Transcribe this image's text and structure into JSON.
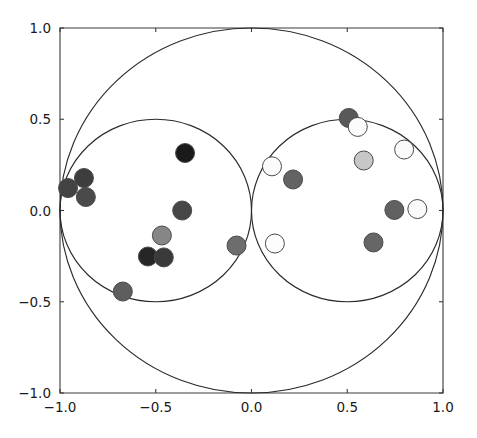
{
  "figure": {
    "title": "",
    "background_color": "#ffffff",
    "axes_color": "#3a3a3a",
    "curve_color": "#2b2b2b",
    "marker_edge_color": "#4a4a4a"
  },
  "chart_data": {
    "type": "scatter",
    "title": "",
    "xlabel": "",
    "ylabel": "",
    "xlim": [
      -1.0,
      1.0
    ],
    "ylim": [
      -1.0,
      1.0
    ],
    "grid": false,
    "legend": null,
    "xticks": [
      -1.0,
      0.0,
      0.5,
      1.0,
      -0.5
    ],
    "xtick_labels": [
      "-1.0",
      "-0.5",
      "0.0",
      "0.5",
      "1.0"
    ],
    "xtick_values": [
      -1.0,
      -0.5,
      0.0,
      0.5,
      1.0
    ],
    "ytick_labels": [
      "-1.0",
      "-0.5",
      "0.0",
      "0.5",
      "1.0"
    ],
    "ytick_values": [
      -1.0,
      -0.5,
      0.0,
      0.5,
      1.0
    ],
    "annotations": [],
    "shapes": [
      {
        "name": "outer-circle",
        "type": "circle",
        "cx": 0.0,
        "cy": 0.0,
        "r": 1.0
      },
      {
        "name": "left-circle",
        "type": "circle",
        "cx": -0.5,
        "cy": 0.0,
        "r": 0.5
      },
      {
        "name": "right-circle",
        "type": "circle",
        "cx": 0.5,
        "cy": 0.0,
        "r": 0.5
      }
    ],
    "marker_size": 9.5,
    "points": [
      {
        "x": -0.958,
        "y": 0.123,
        "color": "#434343",
        "label": "p1"
      },
      {
        "x": -0.875,
        "y": 0.178,
        "color": "#3d3d3d",
        "label": "p2"
      },
      {
        "x": -0.865,
        "y": 0.074,
        "color": "#4a4a4a",
        "label": "p3"
      },
      {
        "x": -0.347,
        "y": 0.315,
        "color": "#1a1a1a",
        "label": "p4"
      },
      {
        "x": -0.362,
        "y": 0.0,
        "color": "#464646",
        "label": "p5"
      },
      {
        "x": -0.468,
        "y": -0.137,
        "color": "#868686",
        "label": "p6"
      },
      {
        "x": -0.541,
        "y": -0.252,
        "color": "#262626",
        "label": "p7"
      },
      {
        "x": -0.458,
        "y": -0.257,
        "color": "#3a3a3a",
        "label": "p8"
      },
      {
        "x": -0.672,
        "y": -0.444,
        "color": "#5e5e5e",
        "label": "p9"
      },
      {
        "x": -0.078,
        "y": -0.192,
        "color": "#6d6d6d",
        "label": "p10"
      },
      {
        "x": 0.107,
        "y": 0.242,
        "color": "#fbfbfb",
        "label": "p11"
      },
      {
        "x": 0.217,
        "y": 0.17,
        "color": "#636363",
        "label": "p12"
      },
      {
        "x": 0.508,
        "y": 0.507,
        "color": "#595959",
        "label": "p13"
      },
      {
        "x": 0.555,
        "y": 0.458,
        "color": "#fcfcfc",
        "label": "p14"
      },
      {
        "x": 0.586,
        "y": 0.274,
        "color": "#c7c7c7",
        "label": "p15"
      },
      {
        "x": 0.797,
        "y": 0.334,
        "color": "#fbfbfb",
        "label": "p16"
      },
      {
        "x": 0.746,
        "y": 0.003,
        "color": "#616161",
        "label": "p17"
      },
      {
        "x": 0.866,
        "y": 0.008,
        "color": "#fbfbfb",
        "label": "p18"
      },
      {
        "x": 0.122,
        "y": -0.181,
        "color": "#fdfdfd",
        "label": "p19"
      },
      {
        "x": 0.637,
        "y": -0.175,
        "color": "#666666",
        "label": "p20"
      }
    ]
  },
  "axes": {
    "left_px": 60,
    "right_px": 443,
    "top_px": 28,
    "bottom_px": 393
  }
}
